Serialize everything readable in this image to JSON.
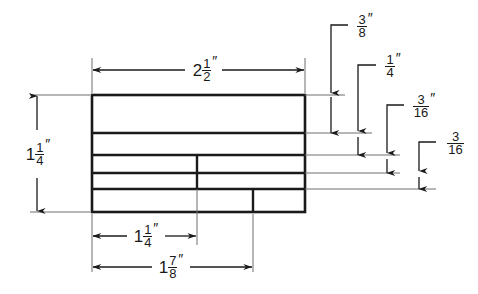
{
  "drawing": {
    "title": "Dimensioned panel elevation",
    "units": "inches",
    "line_color": "#1a1a1a",
    "background_color": "#ffffff",
    "part": {
      "overall_width_label": "2 1/2\"",
      "overall_height_label": "1 1/4\""
    },
    "dimensions": [
      {
        "id": "overall-width",
        "name": "overall-width-dimension",
        "whole": "2",
        "numerator": "1",
        "denominator": "2",
        "inch_mark": "″",
        "position": "top",
        "orientation": "horizontal",
        "value_inches": 2.5
      },
      {
        "id": "overall-height",
        "name": "overall-height-dimension",
        "whole": "1",
        "numerator": "1",
        "denominator": "4",
        "inch_mark": "″",
        "position": "left",
        "orientation": "vertical",
        "value_inches": 1.25
      },
      {
        "id": "inner-width",
        "name": "inner-width-dimension",
        "whole": "1",
        "numerator": "1",
        "denominator": "4",
        "inch_mark": "″",
        "position": "bottom-upper",
        "orientation": "horizontal",
        "value_inches": 1.25
      },
      {
        "id": "outer-width",
        "name": "outer-width-dimension",
        "whole": "1",
        "numerator": "7",
        "denominator": "8",
        "inch_mark": "″",
        "position": "bottom-lower",
        "orientation": "horizontal",
        "value_inches": 1.875
      },
      {
        "id": "band-1",
        "name": "band-thickness-three-eighths",
        "whole": "",
        "numerator": "3",
        "denominator": "8",
        "inch_mark": "″",
        "position": "right-1",
        "orientation": "leader",
        "value_inches": 0.375
      },
      {
        "id": "band-2",
        "name": "band-thickness-one-quarter",
        "whole": "",
        "numerator": "1",
        "denominator": "4",
        "inch_mark": "″",
        "position": "right-2",
        "orientation": "leader",
        "value_inches": 0.25
      },
      {
        "id": "band-3",
        "name": "band-thickness-three-sixteenths-upper",
        "whole": "",
        "numerator": "3",
        "denominator": "16",
        "inch_mark": "″",
        "position": "right-3",
        "orientation": "leader",
        "value_inches": 0.1875
      },
      {
        "id": "band-4",
        "name": "band-thickness-three-sixteenths-lower",
        "whole": "",
        "numerator": "3",
        "denominator": "16",
        "inch_mark": "",
        "position": "right-4",
        "orientation": "leader",
        "value_inches": 0.1875
      }
    ]
  }
}
